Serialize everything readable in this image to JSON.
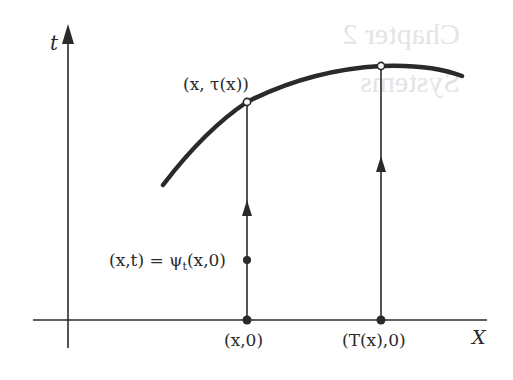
{
  "figure": {
    "type": "phase-space flow diagram",
    "axes": {
      "vertical_label": "t",
      "horizontal_label": "X"
    },
    "labels": {
      "curve_point": "(x, τ(x))",
      "flow_point": "(x,t) = ψ",
      "flow_point_sub": "t",
      "flow_point_tail": "(x,0)",
      "base_point_1": "(x,0)",
      "base_point_2": "(T(x),0)"
    },
    "show_through_text": {
      "line1": "Chapter 2",
      "line2": "Systems"
    },
    "colors": {
      "ink": "#2a2a2a",
      "background": "#ffffff",
      "show_through": "#e4e4e4"
    }
  }
}
